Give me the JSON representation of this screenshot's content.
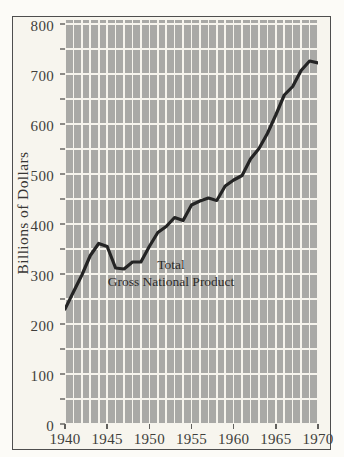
{
  "figure": {
    "y_axis_title": "Billions of Dollars",
    "annotation": {
      "line1": "Total",
      "line2": "Gross National Product"
    }
  },
  "chart_data": {
    "type": "line",
    "title": "Total Gross National Product",
    "ylabel": "Billions of Dollars",
    "xlabel": "",
    "x": [
      1940,
      1941,
      1942,
      1943,
      1944,
      1945,
      1946,
      1947,
      1948,
      1949,
      1950,
      1951,
      1952,
      1953,
      1954,
      1955,
      1956,
      1957,
      1958,
      1959,
      1960,
      1961,
      1962,
      1963,
      1964,
      1965,
      1966,
      1967,
      1968,
      1969,
      1970
    ],
    "series": [
      {
        "name": "Total Gross National Product",
        "values": [
          230,
          264,
          298,
          337,
          361,
          355,
          312,
          310,
          324,
          324,
          355,
          383,
          395,
          413,
          407,
          438,
          446,
          452,
          447,
          476,
          488,
          497,
          530,
          551,
          581,
          618,
          658,
          675,
          707,
          726,
          722
        ]
      }
    ],
    "xlim": [
      1940,
      1970
    ],
    "ylim": [
      0,
      800
    ],
    "xticks": [
      1940,
      1945,
      1950,
      1955,
      1960,
      1965,
      1970
    ],
    "yticks": [
      0,
      100,
      200,
      300,
      400,
      500,
      600,
      700,
      800
    ],
    "y_minor_step": 50,
    "x_grid_step_years": 1,
    "grid": "gray blocks separated by cream gridlines; vertical line every year, horizontal line every 50 units",
    "legend": "none",
    "colors": {
      "line": "#242424",
      "grid_block": "#a9a9a6",
      "gridline": "#f6f4ed",
      "frame_background": "#f7f5ee",
      "frame_border": "#4e4e4e",
      "text": "#403e3b"
    }
  }
}
